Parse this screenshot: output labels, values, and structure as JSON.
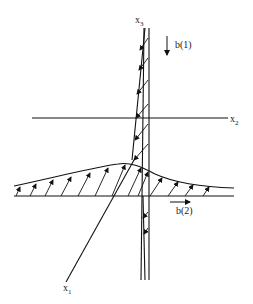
{
  "diagram": {
    "axes": {
      "x1": {
        "label": "x",
        "subscript": "1"
      },
      "x2": {
        "label": "x",
        "subscript": "2"
      },
      "x3": {
        "label": "x",
        "subscript": "3"
      }
    },
    "vectors": {
      "b1": {
        "label": "b(1)"
      },
      "b2": {
        "label": "b(2)"
      }
    },
    "colors": {
      "stroke": "#111111",
      "background": "#ffffff"
    }
  }
}
